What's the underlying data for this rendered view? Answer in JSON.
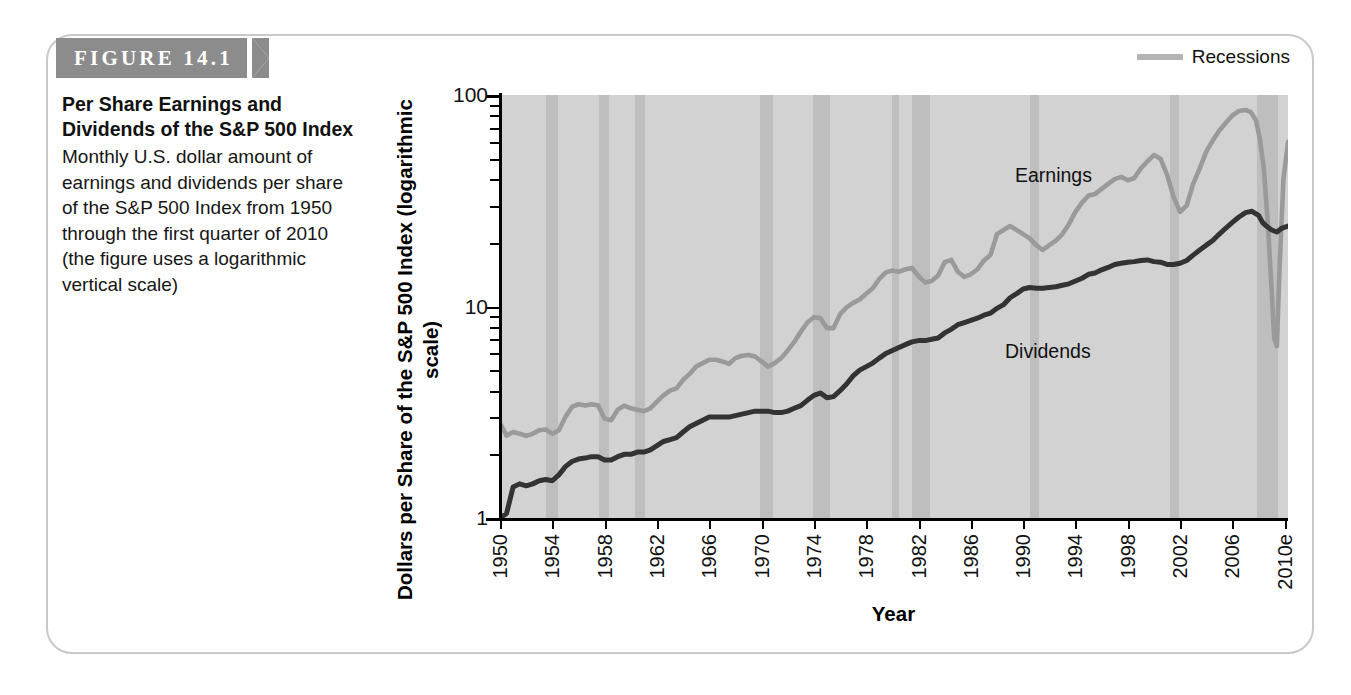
{
  "figure": {
    "banner_label": "FIGURE 14.1",
    "title": "Per Share Earnings and Dividends of the S&P 500 Index",
    "caption": "Monthly U.S. dollar amount of earnings and dividends per share of the S&P 500 Index from 1950 through the first quarter of 2010 (the figure uses a logarithmic vertical scale)"
  },
  "colors": {
    "banner": "#8c8c8c",
    "plot_background": "#d2d2d2",
    "recession_band": "#bebebe",
    "earnings_line": "#9a9a9a",
    "dividends_line": "#333333",
    "border": "#c9c9c9"
  },
  "chart_data": {
    "type": "line",
    "title": "Per Share Earnings and Dividends of the S&P 500 Index",
    "xlabel": "Year",
    "ylabel": "Dollars per Share of the S&P 500 Index (logarithmic scale)",
    "yscale": "log",
    "ylim": [
      1,
      100
    ],
    "ytick_labels": [
      "1",
      "10",
      "100"
    ],
    "ytick_values": [
      1,
      10,
      100
    ],
    "minor_ticks": true,
    "grid": false,
    "xlim": [
      1950,
      2010.25
    ],
    "xtick_labels": [
      "1950",
      "1954",
      "1958",
      "1962",
      "1966",
      "1970",
      "1974",
      "1978",
      "1982",
      "1986",
      "1990",
      "1994",
      "1998",
      "2002",
      "2006",
      "2010e"
    ],
    "xtick_values": [
      1950,
      1954,
      1958,
      1962,
      1966,
      1970,
      1974,
      1978,
      1982,
      1986,
      1990,
      1994,
      1998,
      2002,
      2006,
      2010
    ],
    "legend": {
      "position": "top-right",
      "entries": [
        "Recessions"
      ]
    },
    "annotations": [
      {
        "text": "Earnings",
        "x": 1998.5,
        "y": 42
      },
      {
        "text": "Dividends",
        "x": 1997.5,
        "y": 12.5
      }
    ],
    "recession_bands": [
      {
        "start": 1953.5,
        "end": 1954.4
      },
      {
        "start": 1957.6,
        "end": 1958.3
      },
      {
        "start": 1960.3,
        "end": 1961.1
      },
      {
        "start": 1969.9,
        "end": 1970.9
      },
      {
        "start": 1973.9,
        "end": 1975.2
      },
      {
        "start": 1980.0,
        "end": 1980.5
      },
      {
        "start": 1981.5,
        "end": 1982.9
      },
      {
        "start": 1990.5,
        "end": 1991.2
      },
      {
        "start": 2001.2,
        "end": 2001.9
      },
      {
        "start": 2007.9,
        "end": 2009.5
      }
    ],
    "series": [
      {
        "name": "Earnings",
        "color": "#9a9a9a",
        "x": [
          1950,
          1950.5,
          1951,
          1951.5,
          1952,
          1952.5,
          1953,
          1953.5,
          1954,
          1954.5,
          1955,
          1955.5,
          1956,
          1956.5,
          1957,
          1957.5,
          1958,
          1958.5,
          1959,
          1959.5,
          1960,
          1960.5,
          1961,
          1961.5,
          1962,
          1962.5,
          1963,
          1963.5,
          1964,
          1964.5,
          1965,
          1965.5,
          1966,
          1966.5,
          1967,
          1967.5,
          1968,
          1968.5,
          1969,
          1969.5,
          1970,
          1970.5,
          1971,
          1971.5,
          1972,
          1972.5,
          1973,
          1973.5,
          1974,
          1974.5,
          1975,
          1975.5,
          1976,
          1976.5,
          1977,
          1977.5,
          1978,
          1978.5,
          1979,
          1979.5,
          1980,
          1980.5,
          1981,
          1981.5,
          1982,
          1982.5,
          1983,
          1983.5,
          1984,
          1984.5,
          1985,
          1985.5,
          1986,
          1986.5,
          1987,
          1987.5,
          1988,
          1988.5,
          1989,
          1989.5,
          1990,
          1990.5,
          1991,
          1991.5,
          1992,
          1992.5,
          1993,
          1993.5,
          1994,
          1994.5,
          1995,
          1995.5,
          1996,
          1996.5,
          1997,
          1997.5,
          1998,
          1998.5,
          1999,
          1999.5,
          2000,
          2000.5,
          2001,
          2001.5,
          2002,
          2002.5,
          2003,
          2003.5,
          2004,
          2004.5,
          2005,
          2005.5,
          2006,
          2006.5,
          2007,
          2007.4,
          2007.8,
          2008.1,
          2008.4,
          2008.7,
          2009.0,
          2009.2,
          2009.4,
          2009.6,
          2009.9,
          2010.25
        ],
        "y": [
          2.8,
          2.45,
          2.55,
          2.5,
          2.45,
          2.5,
          2.6,
          2.62,
          2.5,
          2.6,
          3.0,
          3.35,
          3.45,
          3.4,
          3.45,
          3.4,
          2.95,
          2.9,
          3.25,
          3.4,
          3.3,
          3.25,
          3.2,
          3.3,
          3.55,
          3.8,
          4.0,
          4.1,
          4.5,
          4.8,
          5.2,
          5.4,
          5.6,
          5.6,
          5.5,
          5.35,
          5.7,
          5.85,
          5.9,
          5.8,
          5.5,
          5.2,
          5.4,
          5.7,
          6.2,
          6.8,
          7.6,
          8.4,
          8.9,
          8.8,
          7.9,
          7.9,
          9.2,
          9.9,
          10.4,
          10.8,
          11.5,
          12.2,
          13.5,
          14.5,
          14.8,
          14.6,
          15.0,
          15.2,
          13.9,
          13.0,
          13.2,
          14.0,
          16.2,
          16.6,
          14.6,
          13.8,
          14.2,
          15.0,
          16.5,
          17.5,
          22.0,
          23.0,
          24.0,
          23.0,
          22.0,
          21.0,
          19.5,
          18.5,
          19.5,
          20.5,
          22.0,
          24.5,
          28.0,
          31.0,
          33.5,
          34.0,
          36.0,
          38.0,
          40.0,
          41.0,
          39.5,
          40.5,
          45.0,
          48.5,
          52.0,
          50.0,
          42.0,
          33.0,
          28.0,
          30.0,
          38.0,
          45.0,
          54.0,
          61.0,
          68.0,
          74.0,
          80.0,
          84.0,
          85.0,
          83.0,
          76.0,
          62.0,
          45.0,
          25.0,
          12.0,
          7.0,
          6.5,
          15.0,
          40.0,
          60.0
        ]
      },
      {
        "name": "Dividends",
        "color": "#333333",
        "x": [
          1950,
          1950.5,
          1951,
          1951.5,
          1952,
          1952.5,
          1953,
          1953.5,
          1954,
          1954.5,
          1955,
          1955.5,
          1956,
          1956.5,
          1957,
          1957.5,
          1958,
          1958.5,
          1959,
          1959.5,
          1960,
          1960.5,
          1961,
          1961.5,
          1962,
          1962.5,
          1963,
          1963.5,
          1964,
          1964.5,
          1965,
          1965.5,
          1966,
          1966.5,
          1967,
          1967.5,
          1968,
          1968.5,
          1969,
          1969.5,
          1970,
          1970.5,
          1971,
          1971.5,
          1972,
          1972.5,
          1973,
          1973.5,
          1974,
          1974.5,
          1975,
          1975.5,
          1976,
          1976.5,
          1977,
          1977.5,
          1978,
          1978.5,
          1979,
          1979.5,
          1980,
          1980.5,
          1981,
          1981.5,
          1982,
          1982.5,
          1983,
          1983.5,
          1984,
          1984.5,
          1985,
          1985.5,
          1986,
          1986.5,
          1987,
          1987.5,
          1988,
          1988.5,
          1989,
          1989.5,
          1990,
          1990.5,
          1991,
          1991.5,
          1992,
          1992.5,
          1993,
          1993.5,
          1994,
          1994.5,
          1995,
          1995.5,
          1996,
          1996.5,
          1997,
          1997.5,
          1998,
          1998.5,
          1999,
          1999.5,
          2000,
          2000.5,
          2001,
          2001.5,
          2002,
          2002.5,
          2003,
          2003.5,
          2004,
          2004.5,
          2005,
          2005.5,
          2006,
          2006.5,
          2007,
          2007.5,
          2008,
          2008.3,
          2008.6,
          2009,
          2009.4,
          2009.8,
          2010.25
        ],
        "y": [
          1.0,
          1.05,
          1.4,
          1.45,
          1.42,
          1.45,
          1.5,
          1.52,
          1.5,
          1.6,
          1.75,
          1.85,
          1.9,
          1.92,
          1.95,
          1.95,
          1.88,
          1.88,
          1.95,
          2.0,
          2.0,
          2.05,
          2.05,
          2.1,
          2.2,
          2.3,
          2.35,
          2.4,
          2.55,
          2.7,
          2.8,
          2.9,
          3.0,
          3.0,
          3.0,
          3.0,
          3.05,
          3.1,
          3.15,
          3.2,
          3.2,
          3.2,
          3.15,
          3.15,
          3.2,
          3.3,
          3.4,
          3.6,
          3.8,
          3.9,
          3.7,
          3.75,
          4.0,
          4.3,
          4.7,
          5.0,
          5.2,
          5.4,
          5.7,
          6.0,
          6.2,
          6.4,
          6.6,
          6.8,
          6.9,
          6.9,
          7.0,
          7.1,
          7.5,
          7.8,
          8.2,
          8.4,
          8.6,
          8.8,
          9.1,
          9.3,
          9.8,
          10.2,
          11.0,
          11.5,
          12.1,
          12.3,
          12.2,
          12.2,
          12.3,
          12.4,
          12.6,
          12.8,
          13.2,
          13.6,
          14.2,
          14.4,
          14.9,
          15.3,
          15.8,
          16.0,
          16.2,
          16.3,
          16.5,
          16.6,
          16.3,
          16.2,
          15.8,
          15.8,
          16.0,
          16.5,
          17.5,
          18.5,
          19.5,
          20.5,
          22.0,
          23.5,
          25.0,
          26.5,
          27.8,
          28.2,
          27.0,
          25.0,
          24.0,
          23.0,
          22.5,
          23.5,
          24.0
        ]
      }
    ]
  }
}
